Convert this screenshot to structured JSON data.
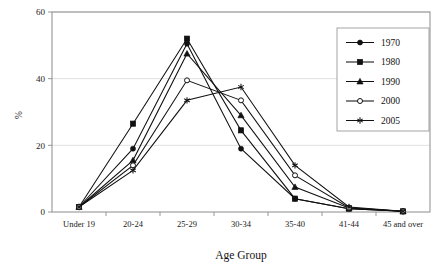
{
  "chart_data": {
    "type": "line",
    "title": "",
    "xlabel": "Age Group",
    "ylabel": "%",
    "ylim": [
      0,
      60
    ],
    "yticks": [
      0,
      20,
      40,
      60
    ],
    "grid": true,
    "legend_position": "top-right",
    "categories": [
      "Under 19",
      "20-24",
      "25-29",
      "30-34",
      "35-40",
      "41-44",
      "45 and over"
    ],
    "series": [
      {
        "name": "1970",
        "marker": "filled-circle",
        "values": [
          1.5,
          19.0,
          50.5,
          19.0,
          4.0,
          1.0,
          0.2
        ]
      },
      {
        "name": "1980",
        "marker": "filled-square",
        "values": [
          1.5,
          26.5,
          52.0,
          24.5,
          4.0,
          1.0,
          0.2
        ]
      },
      {
        "name": "1990",
        "marker": "filled-triangle",
        "values": [
          1.5,
          15.5,
          47.5,
          29.0,
          7.5,
          1.2,
          0.2
        ]
      },
      {
        "name": "2000",
        "marker": "open-circle",
        "values": [
          1.5,
          14.0,
          39.5,
          33.5,
          11.0,
          1.3,
          0.2
        ]
      },
      {
        "name": "2005",
        "marker": "star",
        "values": [
          1.5,
          12.5,
          33.5,
          37.5,
          14.0,
          1.5,
          0.2
        ]
      }
    ]
  },
  "legend": {
    "entries": [
      "1970",
      "1980",
      "1990",
      "2000",
      "2005"
    ]
  },
  "axis": {
    "y_tick_labels": [
      "0",
      "20",
      "40",
      "60"
    ],
    "y_axis_label": "%",
    "x_axis_title": "Age Group",
    "x_tick_labels": [
      "Under 19",
      "20-24",
      "25-29",
      "30-34",
      "35-40",
      "41-44",
      "45 and over"
    ]
  },
  "colors": {
    "ink": "#111111",
    "frame": "#8c8c8c",
    "grid": "#d9d9d9",
    "background": "#ffffff"
  }
}
